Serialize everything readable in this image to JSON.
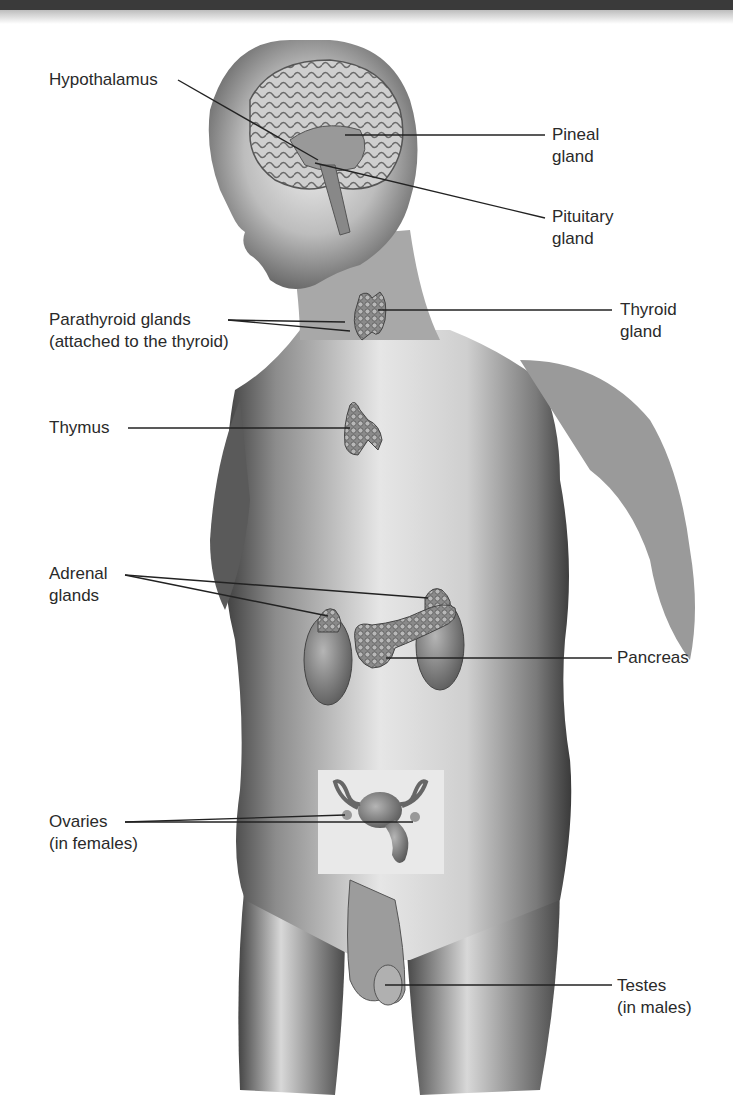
{
  "header_bar": {
    "color": "#3a3a3a"
  },
  "figure": {
    "labels": {
      "hypothalamus": {
        "line1": "Hypothalamus"
      },
      "pineal": {
        "line1": "Pineal",
        "line2": "gland"
      },
      "pituitary": {
        "line1": "Pituitary",
        "line2": "gland"
      },
      "parathyroid": {
        "line1": "Parathyroid glands",
        "line2": "(attached to the thyroid)"
      },
      "thyroid": {
        "line1": "Thyroid",
        "line2": "gland"
      },
      "thymus": {
        "line1": "Thymus"
      },
      "adrenal": {
        "line1": "Adrenal",
        "line2": "glands"
      },
      "pancreas": {
        "line1": "Pancreas"
      },
      "ovaries": {
        "line1": "Ovaries",
        "line2": "(in females)"
      },
      "testes": {
        "line1": "Testes",
        "line2": "(in males)"
      }
    }
  }
}
